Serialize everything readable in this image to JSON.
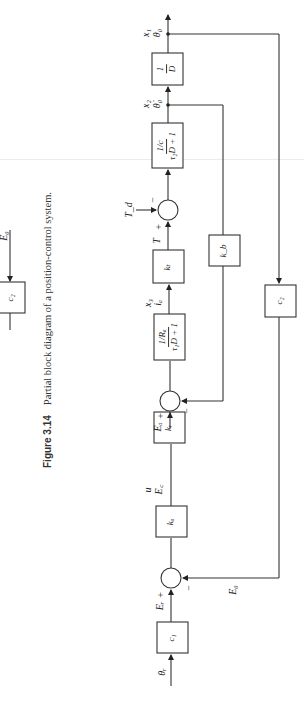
{
  "caption": {
    "figure_number": "Figure 3.14",
    "text": "Partial block diagram of a position-control system."
  },
  "partial_previous_figure": {
    "block_label": "c₂",
    "signal_label": "E₀"
  },
  "forward_path": {
    "input_label": "θᵣ",
    "blocks": [
      {
        "id": "c1",
        "label": "c₁"
      },
      {
        "id": "ka",
        "label": "kₐ"
      },
      {
        "id": "kr",
        "label": "kᵣ"
      },
      {
        "id": "armature",
        "numerator": "1/Rₐ",
        "denominator": "τ₁D + 1"
      },
      {
        "id": "kt",
        "label": "kₜ"
      },
      {
        "id": "mechanical",
        "numerator": "1/c",
        "denominator": "τ₂D + 1"
      },
      {
        "id": "integrator",
        "numerator": "1",
        "denominator": "D"
      }
    ],
    "signals": {
      "Er": "Eᵣ",
      "u": "u",
      "Ec": "E꜀",
      "Ea": "Eₐ",
      "x3": "x₃",
      "ia": "iₐ",
      "T": "T",
      "Td": "T_d",
      "x2": "x₂",
      "theta_dot": "θ̇₀",
      "x1": "x₁",
      "theta_o": "θ₀"
    },
    "summers": [
      {
        "id": "sum1",
        "plus": "+",
        "minus": "−"
      },
      {
        "id": "sum2",
        "plus": "+",
        "minus": "−"
      },
      {
        "id": "sum3",
        "plus": "+",
        "minus": "−"
      }
    ]
  },
  "feedback_paths": {
    "velocity": {
      "block_label": "k_b"
    },
    "position": {
      "block_label": "c₂",
      "signal_label": "E₀"
    }
  }
}
